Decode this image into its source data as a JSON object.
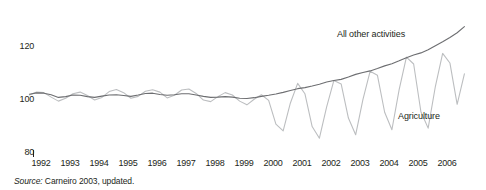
{
  "source_note": {
    "keyword": "Source:",
    "text": " Carneiro 2003, updated."
  },
  "chart_data": {
    "type": "line",
    "title": "",
    "subtitle": "",
    "xlabel": "",
    "ylabel": "",
    "ylim": [
      80,
      130
    ],
    "xlim": [
      1991.5,
      2006.9
    ],
    "grid": false,
    "legend_position": "inline-annotation",
    "yticks": [
      "120",
      "100",
      "80"
    ],
    "ytick_values": [
      120,
      100,
      80
    ],
    "xticks": [
      "1992",
      "1993",
      "1994",
      "1995",
      "1996",
      "1997",
      "1998",
      "1999",
      "2000",
      "2001",
      "2002",
      "2003",
      "2004",
      "2005",
      "2006"
    ],
    "xtick_values": [
      1992,
      1993,
      1994,
      1995,
      1996,
      1997,
      1998,
      1999,
      2000,
      2001,
      2002,
      2003,
      2004,
      2005,
      2006
    ],
    "colors": {
      "all_other_activities": "#6d6e71",
      "agriculture": "#bcbec0",
      "text": "#231f20",
      "background": "#ffffff"
    },
    "annotations": [
      {
        "name": "all-other-activities-label",
        "text": "All other activities",
        "x": 337,
        "y": 30
      },
      {
        "name": "agriculture-label",
        "text": "Agriculture",
        "x": 398,
        "y": 112
      }
    ],
    "series": [
      {
        "name": "All other activities",
        "color": "#6d6e71",
        "x": [
          1991.6,
          1991.85,
          1992.1,
          1992.35,
          1992.6,
          1992.85,
          1993.1,
          1993.35,
          1993.6,
          1993.85,
          1994.1,
          1994.35,
          1994.6,
          1994.85,
          1995.1,
          1995.35,
          1995.6,
          1995.85,
          1996.1,
          1996.35,
          1996.6,
          1996.85,
          1997.1,
          1997.35,
          1997.6,
          1997.85,
          1998.1,
          1998.35,
          1998.6,
          1998.85,
          1999.1,
          1999.35,
          1999.6,
          1999.85,
          2000.1,
          2000.35,
          2000.6,
          2000.85,
          2001.1,
          2001.35,
          2001.6,
          2001.85,
          2002.1,
          2002.35,
          2002.6,
          2002.85,
          2003.1,
          2003.35,
          2003.6,
          2003.85,
          2004.1,
          2004.35,
          2004.6,
          2004.85,
          2005.1,
          2005.35,
          2005.6,
          2005.85,
          2006.1,
          2006.35,
          2006.6
        ],
        "values": [
          101.8,
          102.3,
          102.2,
          101.6,
          100.6,
          100.9,
          101.5,
          101.4,
          100.9,
          100.6,
          101.1,
          101.5,
          101.6,
          101.3,
          101.0,
          101.5,
          102.1,
          102.2,
          101.7,
          101.4,
          101.6,
          102.0,
          102.0,
          101.5,
          101.0,
          100.6,
          100.7,
          100.9,
          100.7,
          100.3,
          100.2,
          100.5,
          101.0,
          101.4,
          101.9,
          102.5,
          103.2,
          103.9,
          104.3,
          104.9,
          105.6,
          106.4,
          107.0,
          107.4,
          108.3,
          109.3,
          110.0,
          110.6,
          111.5,
          112.5,
          113.3,
          114.4,
          115.6,
          116.6,
          117.4,
          118.6,
          120.1,
          121.6,
          123.2,
          125.0,
          127.3
        ]
      },
      {
        "name": "Agriculture",
        "color": "#bcbec0",
        "x": [
          1991.6,
          1991.85,
          1992.1,
          1992.35,
          1992.6,
          1992.85,
          1993.1,
          1993.35,
          1993.6,
          1993.85,
          1994.1,
          1994.35,
          1994.6,
          1994.85,
          1995.1,
          1995.35,
          1995.6,
          1995.85,
          1996.1,
          1996.35,
          1996.6,
          1996.85,
          1997.1,
          1997.35,
          1997.6,
          1997.85,
          1998.1,
          1998.35,
          1998.6,
          1998.85,
          1999.1,
          1999.35,
          1999.6,
          1999.85,
          2000.1,
          2000.35,
          2000.6,
          2000.85,
          2001.1,
          2001.35,
          2001.6,
          2001.85,
          2002.1,
          2002.35,
          2002.6,
          2002.85,
          2003.1,
          2003.35,
          2003.6,
          2003.85,
          2004.1,
          2004.35,
          2004.6,
          2004.85,
          2005.1,
          2005.35,
          2005.6,
          2005.85,
          2006.1,
          2006.35,
          2006.6
        ],
        "values": [
          101.5,
          102.6,
          102.4,
          100.7,
          99.2,
          100.3,
          102.0,
          102.6,
          101.3,
          99.6,
          100.6,
          102.8,
          103.6,
          102.4,
          100.3,
          101.0,
          102.9,
          103.5,
          102.6,
          100.4,
          101.4,
          103.4,
          103.8,
          102.1,
          99.6,
          99.0,
          100.9,
          102.4,
          101.5,
          99.2,
          97.8,
          99.9,
          101.6,
          99.5,
          90.5,
          88.0,
          98.5,
          105.9,
          102.0,
          89.6,
          85.2,
          97.0,
          107.0,
          105.7,
          92.8,
          86.5,
          99.8,
          110.5,
          109.0,
          95.0,
          88.4,
          103.5,
          115.8,
          113.2,
          95.2,
          89.0,
          104.8,
          117.2,
          113.6,
          98.0,
          109.5
        ]
      }
    ]
  }
}
